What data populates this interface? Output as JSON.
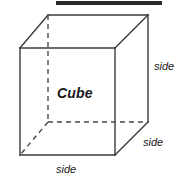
{
  "figure": {
    "type": "geometry-diagram",
    "subject": "cube",
    "width": 185,
    "height": 181,
    "background_color": "#ffffff",
    "line_color": "#3b3b3b",
    "text_color": "#161616"
  },
  "top_bar": {
    "name": "redaction-bar",
    "color": "#2b2b2b",
    "x": 56,
    "y": 1,
    "width": 106,
    "height": 4
  },
  "labels": {
    "center": "Cube",
    "side_right": "side",
    "side_lower_right": "side",
    "side_bottom": "side"
  },
  "geometry": {
    "front_face": {
      "top_left": [
        20,
        48
      ],
      "top_right": [
        115,
        48
      ],
      "bottom_right": [
        115,
        155
      ],
      "bottom_left": [
        20,
        155
      ]
    },
    "back_face": {
      "top_left": [
        48,
        15
      ],
      "top_right": [
        148,
        15
      ],
      "bottom_right": [
        148,
        122
      ],
      "bottom_left": [
        48,
        122
      ]
    },
    "hidden_vertex": [
      48,
      122
    ],
    "hidden_edges": [
      "back-top-left to back-bottom-left",
      "back-bottom-left to back-bottom-right",
      "back-bottom-left to front-bottom-left"
    ]
  }
}
